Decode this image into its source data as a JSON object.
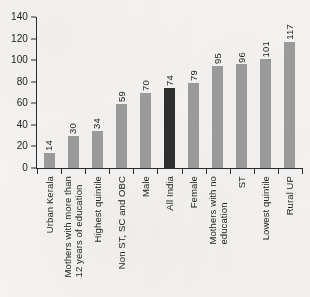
{
  "chart_data": {
    "type": "bar",
    "title": "",
    "xlabel": "",
    "ylabel": "",
    "ylim": [
      0,
      140
    ],
    "yticks": [
      0,
      20,
      40,
      60,
      80,
      100,
      120,
      140
    ],
    "grid": false,
    "legend": null,
    "categories": [
      "Urban Kerala",
      "Mothers with more than\n12 years of education",
      "Highest quintile",
      "Non ST, SC and OBC",
      "Male",
      "All India",
      "Female",
      "Mothers with no\neducation",
      "ST",
      "Lowest quintile",
      "Rural UP"
    ],
    "values": [
      14,
      30,
      34,
      59,
      70,
      74,
      79,
      95,
      96,
      101,
      117
    ],
    "value_labels": [
      "14",
      "30",
      "34",
      "59",
      "70",
      "74",
      "79",
      "95",
      "96",
      "101",
      "117"
    ],
    "highlight_index": 5,
    "colors": {
      "bar": "#9a9a9a",
      "bar_highlight": "#2e2e2e",
      "axis": "#2b2b2b",
      "text": "#1d1d1b",
      "background": "#f4f3f1"
    }
  }
}
